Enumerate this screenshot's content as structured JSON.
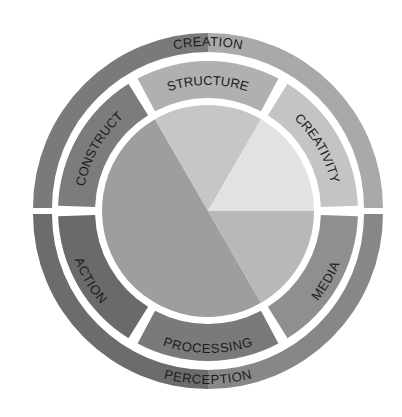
{
  "diagram": {
    "outer_ring": {
      "top_label": "CREATION",
      "bottom_label": "PERCEPTION"
    },
    "middle_ring": {
      "segments": [
        {
          "label": "STRUCTURE",
          "color": "#b0b0b0"
        },
        {
          "label": "CREATIVITY",
          "color": "#c4c4c4"
        },
        {
          "label": "MEDIA",
          "color": "#8f8f8f"
        },
        {
          "label": "PROCESSING",
          "color": "#7a7a7a"
        },
        {
          "label": "ACTION",
          "color": "#6a6a6a"
        },
        {
          "label": "CONSTRUCT",
          "color": "#7c7c7c"
        }
      ]
    },
    "colors": {
      "background": "#ffffff",
      "gap": "#ffffff",
      "text": "#1c1c1c",
      "outer_top_left": "#7a7a7a",
      "outer_top_right": "#b4b4b4",
      "outer_bottom_left": "#6c6c6c",
      "outer_bottom_right": "#8a8a8a",
      "pie_large": "#9e9e9e",
      "pie_top": "#c6c6c6",
      "pie_upper_right": "#e2e2e2",
      "pie_lower_right": "#b8b8b8"
    }
  }
}
